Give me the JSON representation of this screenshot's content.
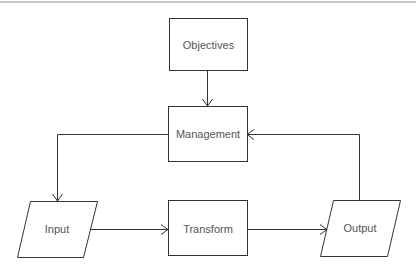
{
  "diagram": {
    "type": "flowchart",
    "nodes": [
      {
        "id": "objectives",
        "label": "Objectives",
        "shape": "rectangle"
      },
      {
        "id": "management",
        "label": "Management",
        "shape": "rectangle"
      },
      {
        "id": "input",
        "label": "Input",
        "shape": "parallelogram"
      },
      {
        "id": "transform",
        "label": "Transform",
        "shape": "rectangle"
      },
      {
        "id": "output",
        "label": "Output",
        "shape": "parallelogram"
      }
    ],
    "edges": [
      {
        "from": "objectives",
        "to": "management"
      },
      {
        "from": "management",
        "to": "input"
      },
      {
        "from": "input",
        "to": "transform"
      },
      {
        "from": "transform",
        "to": "output"
      },
      {
        "from": "output",
        "to": "management"
      }
    ]
  },
  "colors": {
    "stroke": "#333333",
    "text": "#555555",
    "background": "#ffffff",
    "top_rule": "#c8c8c8"
  }
}
